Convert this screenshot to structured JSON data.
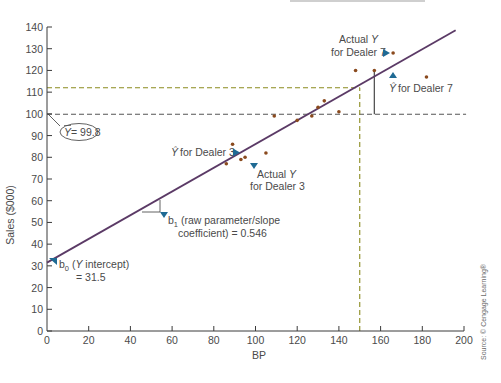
{
  "chart_data": {
    "type": "scatter",
    "title": "",
    "xlabel": "BP",
    "ylabel": "Sales ($000)",
    "xlim": [
      0,
      200
    ],
    "ylim": [
      0,
      140
    ],
    "x_ticks": [
      0,
      20,
      40,
      60,
      80,
      100,
      120,
      140,
      160,
      180,
      200
    ],
    "y_ticks": [
      0,
      10,
      20,
      30,
      40,
      50,
      60,
      70,
      80,
      90,
      100,
      110,
      120,
      130,
      140
    ],
    "grid": false,
    "series": [
      {
        "name": "Dealers",
        "type": "scatter",
        "color": "#8a4a1e",
        "points": [
          {
            "x": 86,
            "y": 77
          },
          {
            "x": 89,
            "y": 86
          },
          {
            "x": 93,
            "y": 79
          },
          {
            "x": 95,
            "y": 80
          },
          {
            "x": 105,
            "y": 82
          },
          {
            "x": 109,
            "y": 99
          },
          {
            "x": 120,
            "y": 97
          },
          {
            "x": 127,
            "y": 99
          },
          {
            "x": 130,
            "y": 103
          },
          {
            "x": 133,
            "y": 106
          },
          {
            "x": 140,
            "y": 101
          },
          {
            "x": 148,
            "y": 120
          },
          {
            "x": 157,
            "y": 120
          },
          {
            "x": 166,
            "y": 128
          },
          {
            "x": 182,
            "y": 117
          }
        ]
      },
      {
        "name": "Regression line",
        "type": "line",
        "color": "#5b3a66",
        "intercept": 31.5,
        "slope": 0.546,
        "x_range": [
          0,
          196
        ]
      }
    ],
    "reference_lines": [
      {
        "orientation": "horizontal",
        "y": 99.8,
        "style": "dashed",
        "color": "#555555",
        "label": "Y-bar = 99.8"
      },
      {
        "orientation": "horizontal",
        "y": 112,
        "x_range": [
          0,
          150
        ],
        "style": "dashed",
        "color": "#8a8a1e"
      },
      {
        "orientation": "vertical",
        "x": 150,
        "y_range": [
          0,
          112
        ],
        "style": "dashed",
        "color": "#8a8a1e"
      },
      {
        "orientation": "vertical",
        "x": 157,
        "y_range": [
          99.8,
          120
        ],
        "style": "solid",
        "color": "#555555"
      }
    ],
    "annotations": [
      {
        "id": "ybar",
        "text": "Ȳ = 99.8"
      },
      {
        "id": "yhat3",
        "text": "Ŷ for Dealer 3"
      },
      {
        "id": "actual3",
        "line1": "Actual Y",
        "line2": "for Dealer 3"
      },
      {
        "id": "actual7",
        "line1": "Actual Y",
        "line2": "for Dealer 7"
      },
      {
        "id": "yhat7",
        "text": "Ŷ for Dealer 7"
      },
      {
        "id": "b1",
        "line1": "b₁ (raw parameter/slope",
        "line2": "coefficient) = 0.546"
      },
      {
        "id": "b0",
        "line1": "b₀ (Y intercept)",
        "line2": "= 31.5"
      }
    ],
    "source": "Source: © Cengage Learning®"
  },
  "colors": {
    "axis": "#3a3a3a",
    "regression": "#5b3a66",
    "point": "#8a4a1e",
    "arrow": "#1f6a94",
    "mean_dash": "#555555",
    "pred_dash": "#8a8a1e",
    "text": "#4a4a4a"
  },
  "labels": {
    "ylabel": "Sales ($000)",
    "xlabel": "BP",
    "ybar": "= 99.8",
    "ybar_symbol": "Y",
    "yhat3": "for Dealer 3",
    "yhat_symbol": "Ŷ",
    "actual3_line1": "Actual",
    "actual3_y": "Y",
    "actual3_line2": "for Dealer 3",
    "actual7_line1": "Actual",
    "actual7_y": "Y",
    "actual7_line2": "for Dealer 7",
    "yhat7": "for Dealer 7",
    "b1_prefix": "b",
    "b1_sub": "1",
    "b1_line1": " (raw parameter/slope",
    "b1_line2": "coefficient) = 0.546",
    "b0_prefix": "b",
    "b0_sub": "0",
    "b0_open": " (",
    "b0_y": "Y",
    "b0_rest": " intercept)",
    "b0_line2": "= 31.5",
    "source": "Source: © Cengage Learning®"
  }
}
